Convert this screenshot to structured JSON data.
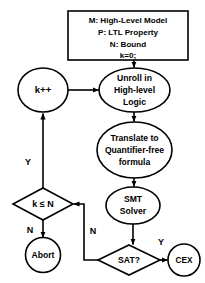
{
  "diagram": {
    "stroke_color": "#000000",
    "fill_color": "#ffffff",
    "background_color": "#ffffff",
    "nodes": {
      "init_box": {
        "shape": "rectangle",
        "lines": [
          "M: High-Level Model",
          "P: LTL Property",
          "N: Bound",
          "k=0;"
        ]
      },
      "unroll": {
        "shape": "ellipse",
        "lines": [
          "Unroll in",
          "High-level",
          "Logic"
        ]
      },
      "increment": {
        "shape": "ellipse",
        "lines": [
          "k++"
        ]
      },
      "translate": {
        "shape": "ellipse",
        "lines": [
          "Translate to",
          "Quantifier-free",
          "formula"
        ]
      },
      "smt_solver": {
        "shape": "ellipse",
        "lines": [
          "SMT",
          "Solver"
        ]
      },
      "bound_check": {
        "shape": "diamond",
        "lines": [
          "k ≤ N"
        ]
      },
      "abort": {
        "shape": "circle",
        "lines": [
          "Abort"
        ]
      },
      "sat_check": {
        "shape": "diamond",
        "lines": [
          "SAT?"
        ]
      },
      "cex": {
        "shape": "circle",
        "lines": [
          "CEX"
        ]
      }
    },
    "edge_labels": {
      "bound_yes": "Y",
      "bound_no": "N",
      "sat_no": "N",
      "sat_yes": "Y"
    }
  }
}
